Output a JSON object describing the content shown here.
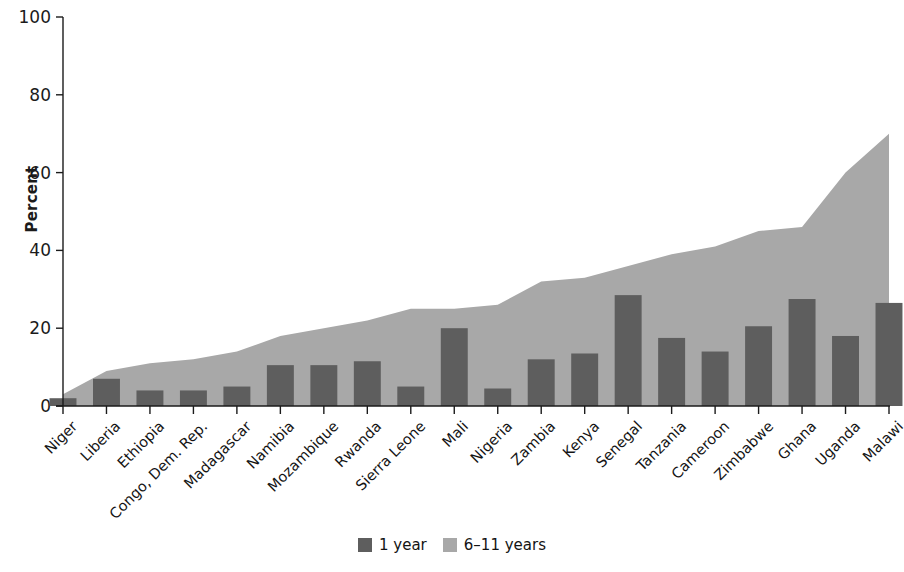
{
  "chart_data": {
    "type": "bar",
    "title": "",
    "xlabel": "",
    "ylabel": "Percent",
    "ylim": [
      0,
      100
    ],
    "yticks": [
      0,
      20,
      40,
      60,
      80,
      100
    ],
    "grid": false,
    "legend_position": "bottom-center",
    "categories": [
      "Niger",
      "Liberia",
      "Ethiopia",
      "Congo, Dem. Rep.",
      "Madagascar",
      "Namibia",
      "Mozambique",
      "Rwanda",
      "Sierra Leone",
      "Mali",
      "Nigeria",
      "Zambia",
      "Kenya",
      "Senegal",
      "Tanzania",
      "Cameroon",
      "Zimbabwe",
      "Ghana",
      "Uganda",
      "Malawi"
    ],
    "series": [
      {
        "name": "6–11 years",
        "render": "area",
        "color": "#a8a8a8",
        "values": [
          3,
          9,
          11,
          12,
          14,
          18,
          20,
          22,
          25,
          25,
          26,
          32,
          33,
          36,
          39,
          41,
          45,
          46,
          60,
          70
        ]
      },
      {
        "name": "1 year",
        "render": "bar",
        "color": "#5e5e5e",
        "values": [
          2,
          7,
          4,
          4,
          5,
          10.5,
          10.5,
          11.5,
          5,
          20,
          4.5,
          12,
          13.5,
          28.5,
          17.5,
          14,
          20.5,
          27.5,
          18,
          26.5
        ]
      }
    ]
  },
  "legend": {
    "items": [
      {
        "label": "1 year",
        "color": "#5e5e5e"
      },
      {
        "label": "6–11 years",
        "color": "#a8a8a8"
      }
    ]
  },
  "axis": {
    "y_title": "Percent"
  }
}
